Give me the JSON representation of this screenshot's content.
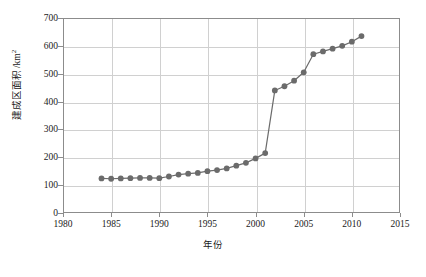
{
  "chart_data": {
    "type": "line",
    "title": "",
    "subtitle": "",
    "xlabel": "年份",
    "ylabel": "建成区面积 /km²",
    "ylabel_text": "建成区面积 /km",
    "ylabel_sup": "2",
    "xlim": [
      1980,
      2015
    ],
    "ylim": [
      0,
      700
    ],
    "xticks": [
      1980,
      1985,
      1990,
      1995,
      2000,
      2005,
      2010,
      2015
    ],
    "yticks": [
      0,
      100,
      200,
      300,
      400,
      500,
      600,
      700
    ],
    "grid": true,
    "legend": null,
    "marker": "circle",
    "marker_color": "#6b6b6b",
    "line_color": "#6b6b6b",
    "x": [
      1984,
      1985,
      1986,
      1987,
      1988,
      1989,
      1990,
      1991,
      1992,
      1993,
      1994,
      1995,
      1996,
      1997,
      1998,
      1999,
      2000,
      2001,
      2002,
      2003,
      2004,
      2005,
      2006,
      2007,
      2008,
      2009,
      2010,
      2011
    ],
    "values": [
      124,
      123,
      124,
      125,
      126,
      126,
      125,
      131,
      138,
      141,
      144,
      150,
      154,
      160,
      170,
      180,
      196,
      215,
      440,
      455,
      475,
      505,
      570,
      580,
      590,
      600,
      615,
      635
    ],
    "series": [
      {
        "name": "建成区面积",
        "x": [
          1984,
          1985,
          1986,
          1987,
          1988,
          1989,
          1990,
          1991,
          1992,
          1993,
          1994,
          1995,
          1996,
          1997,
          1998,
          1999,
          2000,
          2001,
          2002,
          2003,
          2004,
          2005,
          2006,
          2007,
          2008,
          2009,
          2010,
          2011
        ],
        "values": [
          124,
          123,
          124,
          125,
          126,
          126,
          125,
          131,
          138,
          141,
          144,
          150,
          154,
          160,
          170,
          180,
          196,
          215,
          440,
          455,
          475,
          505,
          570,
          580,
          590,
          600,
          615,
          635
        ]
      }
    ],
    "annotations": []
  },
  "axis": {
    "y_tick_labels": [
      "0",
      "100",
      "200",
      "300",
      "400",
      "500",
      "600",
      "700"
    ],
    "x_tick_labels": [
      "1980",
      "1985",
      "1990",
      "1995",
      "2000",
      "2005",
      "2010",
      "2015"
    ]
  }
}
